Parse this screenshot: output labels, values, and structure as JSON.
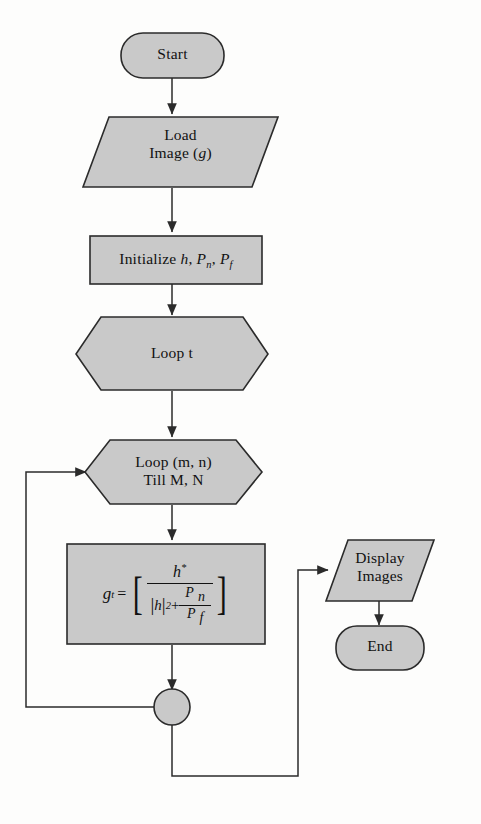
{
  "diagram": {
    "fill_color": "#c9c9c9",
    "stroke_color": "#2b2b2b",
    "background_color": "#fdfdfc",
    "nodes": {
      "start": {
        "label": "Start",
        "shape": "terminator"
      },
      "load_image": {
        "line1": "Load",
        "line2_pre": "Image (",
        "line2_var": "g",
        "line2_post": ")",
        "shape": "parallelogram"
      },
      "initialize": {
        "pre": "Initialize ",
        "var_h": "h",
        "sep1": ", ",
        "var_p": "P",
        "sub_n": "n",
        "sep2": ", ",
        "var_p2": "P",
        "sub_f": "f",
        "shape": "process"
      },
      "loop_t": {
        "label": "Loop t",
        "shape": "hexagon"
      },
      "loop_mn": {
        "line1": "Loop (m, n)",
        "line2": "Till M, N",
        "shape": "hexagon"
      },
      "formula": {
        "lhs_var": "g",
        "lhs_sup": "t",
        "equals": "=",
        "bracket_open": "[",
        "bracket_close": "]",
        "numerator_var": "h",
        "numerator_star": "*",
        "denom_abs_open": "|",
        "denom_abs_var": "h",
        "denom_abs_close": "|",
        "denom_exp": "2",
        "denom_plus": "+",
        "denom_frac_num_var": "P",
        "denom_frac_num_sub": "n",
        "denom_frac_den_var": "P",
        "denom_frac_den_sub": "f",
        "shape": "process",
        "plain_text": "g^t = [ h* / ( |h|^2 + P_n / P_f ) ]"
      },
      "junction": {
        "label": "",
        "shape": "connector-circle"
      },
      "display_images": {
        "line1": "Display",
        "line2": "Images",
        "shape": "parallelogram"
      },
      "end": {
        "label": "End",
        "shape": "terminator"
      }
    },
    "edges": [
      {
        "from": "start",
        "to": "load_image",
        "arrow": true
      },
      {
        "from": "load_image",
        "to": "initialize",
        "arrow": true
      },
      {
        "from": "initialize",
        "to": "loop_t",
        "arrow": true
      },
      {
        "from": "loop_t",
        "to": "loop_mn",
        "arrow": true
      },
      {
        "from": "loop_mn",
        "to": "formula",
        "arrow": true
      },
      {
        "from": "formula",
        "to": "junction",
        "arrow": true
      },
      {
        "from": "junction",
        "to": "loop_mn",
        "arrow": true,
        "routing": "left-feedback"
      },
      {
        "from": "junction",
        "to": "display_images",
        "arrow": true,
        "routing": "bottom-right"
      },
      {
        "from": "display_images",
        "to": "end",
        "arrow": true
      }
    ]
  }
}
